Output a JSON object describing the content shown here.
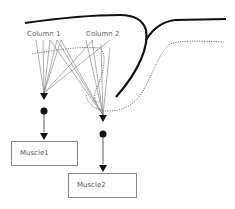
{
  "diagram": {
    "columns": [
      {
        "label": "Column 1"
      },
      {
        "label": "Column 2"
      }
    ],
    "muscles": [
      {
        "label": "Muscle1"
      },
      {
        "label": "Muscle2"
      }
    ],
    "colors": {
      "line": "#222222",
      "fiber": "#777777",
      "dotted": "#555555",
      "box_border": "#888888"
    }
  }
}
